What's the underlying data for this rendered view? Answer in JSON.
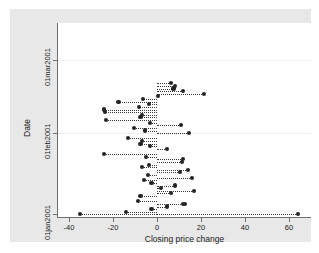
{
  "figure": {
    "background_color": "#e8e8e8",
    "plot_background_color": "#ffffff",
    "axis_color": "#6f6f6f",
    "marker_color": "#232323",
    "gridline_color": "#eceff1"
  },
  "chart_data": {
    "type": "scatter",
    "title": "",
    "xlabel": "Closing price change",
    "ylabel": "Date",
    "xlim": [
      -45,
      70
    ],
    "ylim": [
      0,
      74
    ],
    "grid": true,
    "legend": null,
    "xticks": [
      -40,
      -20,
      0,
      20,
      40,
      60
    ],
    "xticklabels": [
      "-40",
      "-20",
      "0",
      "20",
      "40",
      "60"
    ],
    "yticks": [
      1,
      32,
      60
    ],
    "yticklabels": [
      "01jan2001",
      "01feb2001",
      "01mar2001"
    ],
    "gridlines_y": [
      32,
      60
    ],
    "baseline_x": 0,
    "marker_style": "filled-circle",
    "connector_style": "dotted-spike-to-zero",
    "points": [
      {
        "day": 1,
        "value": -35.0
      },
      {
        "day": 1,
        "value": 64.0
      },
      {
        "day": 2,
        "value": -14.0
      },
      {
        "day": 3,
        "value": -2.5
      },
      {
        "day": 4,
        "value": 4.5
      },
      {
        "day": 5,
        "value": 12.0
      },
      {
        "day": 5,
        "value": 12.8
      },
      {
        "day": 6,
        "value": -8.5
      },
      {
        "day": 8,
        "value": -7.5
      },
      {
        "day": 9,
        "value": 6.5
      },
      {
        "day": 10,
        "value": 17.0
      },
      {
        "day": 11,
        "value": 2.0
      },
      {
        "day": 12,
        "value": 8.0
      },
      {
        "day": 13,
        "value": -2.5
      },
      {
        "day": 14,
        "value": -6.0
      },
      {
        "day": 15,
        "value": 16.0
      },
      {
        "day": 16,
        "value": -4.0
      },
      {
        "day": 17,
        "value": 10.5
      },
      {
        "day": 18,
        "value": 14.0
      },
      {
        "day": 19,
        "value": -7.0
      },
      {
        "day": 20,
        "value": -3.5
      },
      {
        "day": 21,
        "value": 11.5
      },
      {
        "day": 22,
        "value": 11.8
      },
      {
        "day": 23,
        "value": -5.0
      },
      {
        "day": 24,
        "value": -24.0
      },
      {
        "day": 26,
        "value": 4.5
      },
      {
        "day": 27,
        "value": -3.0
      },
      {
        "day": 28,
        "value": -7.5
      },
      {
        "day": 29,
        "value": -7.0
      },
      {
        "day": 30,
        "value": -13.0
      },
      {
        "day": 32,
        "value": 14.5
      },
      {
        "day": 33,
        "value": -5.5
      },
      {
        "day": 34,
        "value": -10.5
      },
      {
        "day": 35,
        "value": 11.0
      },
      {
        "day": 36,
        "value": -3.0
      },
      {
        "day": 37,
        "value": -23.0
      },
      {
        "day": 38,
        "value": -7.5
      },
      {
        "day": 39,
        "value": -7.0
      },
      {
        "day": 40,
        "value": -23.6
      },
      {
        "day": 41,
        "value": -23.9
      },
      {
        "day": 42,
        "value": -8.0
      },
      {
        "day": 43,
        "value": -3.5
      },
      {
        "day": 44,
        "value": -17.5
      },
      {
        "day": 45,
        "value": -6.5
      },
      {
        "day": 46,
        "value": 0.5
      },
      {
        "day": 47,
        "value": 21.5
      },
      {
        "day": 48,
        "value": 12.0
      },
      {
        "day": 49,
        "value": 7.5
      },
      {
        "day": 50,
        "value": 8.0
      },
      {
        "day": 51,
        "value": 6.5
      }
    ]
  },
  "axes": {
    "x_title": "Closing price change",
    "y_title": "Date",
    "x_tick_labels": [
      "-40",
      "-20",
      "0",
      "20",
      "40",
      "60"
    ],
    "y_tick_labels": [
      "01jan2001",
      "01feb2001",
      "01mar2001"
    ]
  }
}
